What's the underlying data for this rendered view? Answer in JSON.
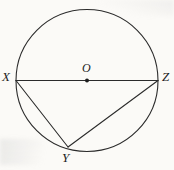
{
  "figure": {
    "kind": "circle-geometry-diagram",
    "background_color": "#fbfaf7",
    "stroke_color": "#2b2b2b",
    "label_color": "#1d1d1d",
    "circle": {
      "center_x": 87,
      "center_y": 80.5,
      "radius": 71,
      "stroke_width": 1.1
    },
    "center_point": {
      "x": 87,
      "y": 80.5,
      "radius": 2
    },
    "points": [
      {
        "id": "X",
        "label": "X",
        "x": 16,
        "y": 80.5
      },
      {
        "id": "Z",
        "label": "Z",
        "x": 158,
        "y": 80.5
      },
      {
        "id": "Y",
        "label": "Y",
        "x": 68,
        "y": 147
      },
      {
        "id": "O",
        "label": "O",
        "x": 87,
        "y": 80.5
      }
    ],
    "segments": [
      {
        "id": "XZ",
        "from": "X",
        "to": "Z",
        "x1": 16,
        "y1": 80.5,
        "x2": 158,
        "y2": 80.5,
        "kind": "diameter"
      },
      {
        "id": "XY",
        "from": "X",
        "to": "Y",
        "x1": 16,
        "y1": 80.5,
        "x2": 68,
        "y2": 147,
        "kind": "chord"
      },
      {
        "id": "ZY",
        "from": "Z",
        "to": "Y",
        "x1": 158,
        "y1": 80.5,
        "x2": 68,
        "y2": 147,
        "kind": "chord"
      }
    ],
    "labels": {
      "x": "X",
      "z": "Z",
      "y": "Y",
      "o": "O"
    }
  }
}
